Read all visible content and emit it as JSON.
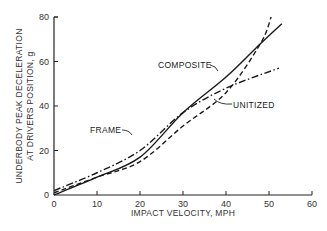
{
  "chart_data": {
    "type": "line",
    "title": "",
    "xlabel": "IMPACT VELOCITY, MPH",
    "ylabel_line1": "UNDERBODY PEAK DECELERATION",
    "ylabel_line2": "AT DRIVERS POSITION, g",
    "xlim": [
      0,
      60
    ],
    "ylim": [
      0,
      80
    ],
    "x_ticks": [
      "0",
      "10",
      "20",
      "30",
      "40",
      "50",
      "60"
    ],
    "y_ticks": [
      "0",
      "20",
      "40",
      "60",
      "80"
    ],
    "grid": false,
    "legend": "inline annotations",
    "series": [
      {
        "name": "COMPOSITE",
        "style": "solid",
        "x": [
          0,
          10,
          20,
          30,
          40,
          48,
          53
        ],
        "y": [
          0,
          8,
          17,
          37,
          53,
          68,
          77
        ]
      },
      {
        "name": "UNITIZED",
        "style": "dashed",
        "x": [
          0,
          10,
          20,
          30,
          40,
          48,
          50.5
        ],
        "y": [
          1,
          8,
          15,
          31,
          46,
          68,
          80
        ]
      },
      {
        "name": "FRAME",
        "style": "dash-dot",
        "x": [
          0,
          10,
          20,
          30,
          40,
          52.3
        ],
        "y": [
          2,
          10,
          20,
          37,
          48,
          57
        ]
      }
    ],
    "annotations": [
      "COMPOSITE",
      "UNITIZED",
      "FRAME"
    ]
  }
}
